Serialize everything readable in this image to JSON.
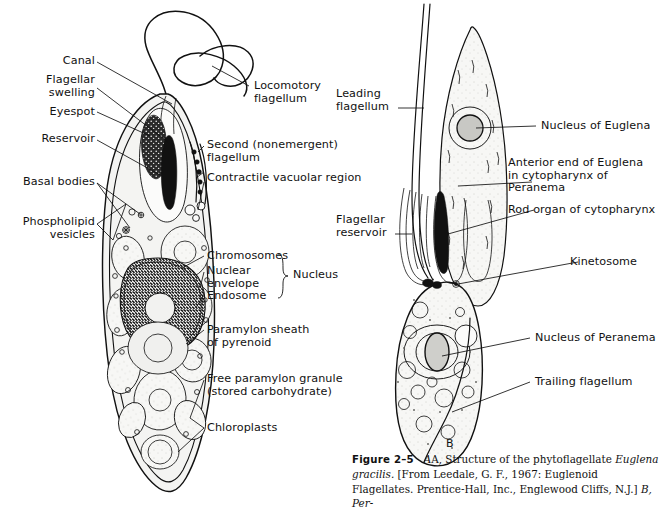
{
  "figure": {
    "panel_a_letter": "",
    "panel_b_letter": "B",
    "caption_label": "Figure 2–5",
    "caption_text_1": "A, Structure of the phytoflagellate ",
    "caption_italic_1": "Euglena gracilis.",
    "caption_text_2": " [From Leedale, G. F., 1967: Euglenoid Flagellates. Prentice-Hall, Inc., Englewood Cliffs, N.J.] ",
    "caption_text_3": "B, Per-"
  },
  "panel_a_labels": {
    "left": [
      {
        "id": "canal",
        "text": "Canal"
      },
      {
        "id": "flagellar-swelling",
        "text": "Flagellar\nswelling"
      },
      {
        "id": "eyespot",
        "text": "Eyespot"
      },
      {
        "id": "reservoir",
        "text": "Reservoir"
      },
      {
        "id": "basal-bodies",
        "text": "Basal bodies"
      },
      {
        "id": "phospholipid-vesicles",
        "text": "Phospholipid\nvesicles"
      }
    ],
    "right": [
      {
        "id": "locomotory-flagellum",
        "text": "Locomotory\nflagellum"
      },
      {
        "id": "second-flagellum",
        "text": "Second (nonemergent)\nflagellum"
      },
      {
        "id": "contractile-vacuolar-region",
        "text": "Contractile vacuolar region"
      },
      {
        "id": "chromosomes",
        "text": "Chromosomes"
      },
      {
        "id": "nuclear-envelope",
        "text": "Nuclear\nenvelope"
      },
      {
        "id": "endosome",
        "text": "Endosome"
      },
      {
        "id": "nucleus",
        "text": "Nucleus"
      },
      {
        "id": "paramylon-sheath",
        "text": "Paramylon sheath\nof pyrenoid"
      },
      {
        "id": "free-paramylon-granule",
        "text": "Free paramylon granule\n(stored carbohydrate)"
      },
      {
        "id": "chloroplasts",
        "text": "Chloroplasts"
      }
    ]
  },
  "panel_b_labels": {
    "left": [
      {
        "id": "leading-flagellum",
        "text": "Leading\nflagellum"
      },
      {
        "id": "flagellar-reservoir",
        "text": "Flagellar\nreservoir"
      }
    ],
    "right": [
      {
        "id": "nucleus-of-euglena",
        "text": "Nucleus of Euglena"
      },
      {
        "id": "anterior-end-of-euglena",
        "text": "Anterior end of Euglena\nin cytopharynx of\nPeranema"
      },
      {
        "id": "rod-organ-of-cytopharynx",
        "text": "Rod organ of cytopharynx"
      },
      {
        "id": "kinetosome",
        "text": "Kinetosome"
      },
      {
        "id": "nucleus-of-peranema",
        "text": "Nucleus of Peranema"
      },
      {
        "id": "trailing-flagellum",
        "text": "Trailing flagellum"
      }
    ]
  },
  "colors": {
    "ink": "#111111",
    "cytoplasm": "#f4f4f2",
    "paper": "#ffffff"
  }
}
